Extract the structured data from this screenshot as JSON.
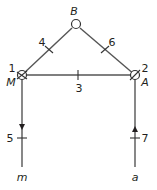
{
  "diagram": {
    "type": "network-graph",
    "colors": {
      "line": "#555555",
      "text": "#231f20",
      "node_fill": "#ffffff"
    },
    "nodes": [
      {
        "id": "B",
        "label": "B",
        "x": 76,
        "y": 24,
        "style": "open-circle"
      },
      {
        "id": "M",
        "label": "M",
        "number": "1",
        "x": 22,
        "y": 75,
        "style": "hatched-circle"
      },
      {
        "id": "A",
        "label": "A",
        "number": "2",
        "x": 135,
        "y": 75,
        "style": "hatched-circle"
      },
      {
        "id": "m",
        "label": "m",
        "x": 22,
        "y": 177,
        "style": "terminal"
      },
      {
        "id": "a",
        "label": "a",
        "x": 135,
        "y": 177,
        "style": "terminal"
      }
    ],
    "edges": [
      {
        "id": "3",
        "label": "3",
        "from": "M",
        "to": "A",
        "directed": false
      },
      {
        "id": "4",
        "label": "4",
        "from": "M",
        "to": "B",
        "directed": false
      },
      {
        "id": "6",
        "label": "6",
        "from": "B",
        "to": "A",
        "directed": false
      },
      {
        "id": "5",
        "label": "5",
        "from": "M",
        "to": "m",
        "directed": true,
        "arrow": "down"
      },
      {
        "id": "7",
        "label": "7",
        "from": "a",
        "to": "A",
        "directed": true,
        "arrow": "up"
      }
    ]
  }
}
